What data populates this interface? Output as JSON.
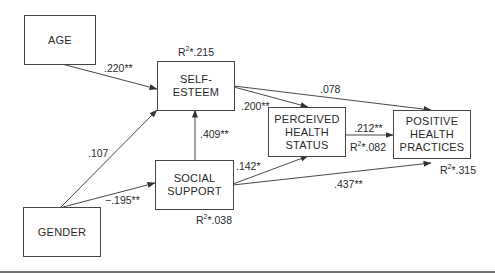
{
  "nodes": {
    "age": {
      "label": "AGE"
    },
    "self_esteem": {
      "label_line1": "SELF-",
      "label_line2": "ESTEEM",
      "r2_prefix": "R",
      "r2_sup": "2",
      "r2_value": "*.215"
    },
    "social_support": {
      "label_line1": "SOCIAL",
      "label_line2": "SUPPORT",
      "r2_prefix": "R",
      "r2_sup": "2",
      "r2_value": "*.038"
    },
    "gender": {
      "label": "GENDER"
    },
    "perceived_health_status": {
      "label_line1": "PERCEIVED",
      "label_line2": "HEALTH",
      "label_line3": "STATUS",
      "r2_prefix": "R",
      "r2_sup": "2",
      "r2_value": "*.082"
    },
    "positive_health_practices": {
      "label_line1": "POSITIVE",
      "label_line2": "HEALTH",
      "label_line3": "PRACTICES",
      "r2_prefix": "R",
      "r2_sup": "2",
      "r2_value": "*.315"
    }
  },
  "edges": {
    "age_to_self_esteem": ".220**",
    "gender_to_self_esteem": ".107",
    "gender_to_social_support": "−.195**",
    "social_support_to_self_esteem": ".409**",
    "self_esteem_to_perceived_health": ".200**",
    "self_esteem_to_positive_practices": ".078",
    "social_support_to_perceived_health": ".142*",
    "social_support_to_positive_practices": ".437**",
    "perceived_health_to_positive_practices": ".212**"
  }
}
